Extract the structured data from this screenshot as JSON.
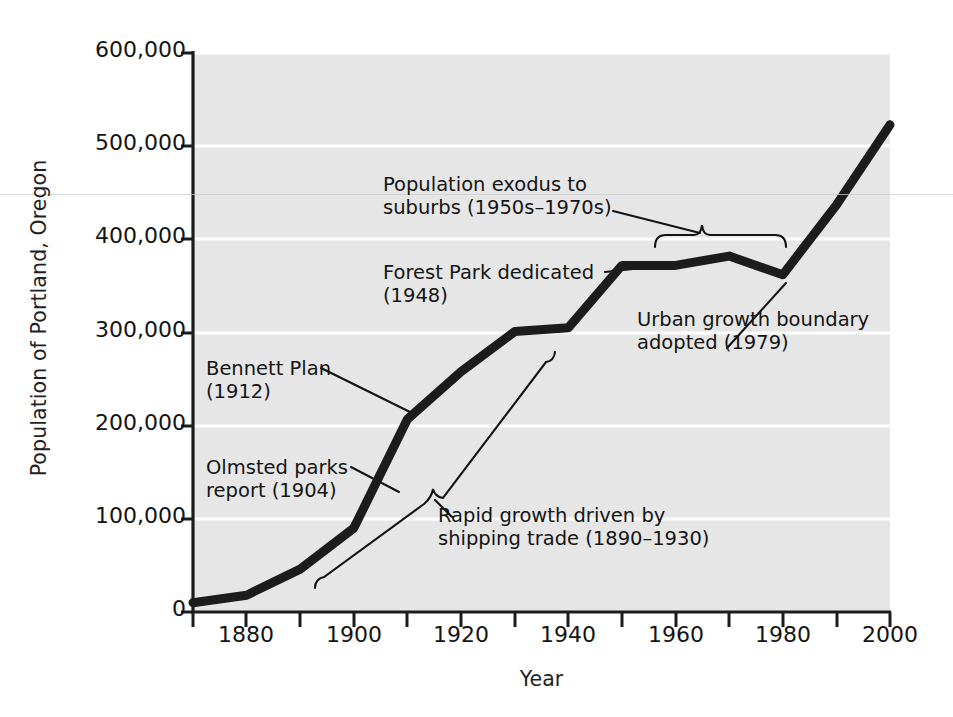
{
  "chart_data": {
    "type": "line",
    "title": "",
    "xlabel": "Year",
    "ylabel": "Population of Portland, Oregon",
    "xlim": [
      1870,
      2000
    ],
    "ylim": [
      0,
      600000
    ],
    "grid": true,
    "legend": "none",
    "x_tick_labels": [
      "1880",
      "1900",
      "1920",
      "1940",
      "1960",
      "1980",
      "2000"
    ],
    "x_tick_values": [
      1880,
      1900,
      1920,
      1940,
      1960,
      1980,
      2000
    ],
    "x_minor_tick_values": [
      1870,
      1890,
      1910,
      1930,
      1950,
      1970,
      1990
    ],
    "y_tick_labels": [
      "0",
      "100,000",
      "200,000",
      "300,000",
      "400,000",
      "500,000",
      "600,000"
    ],
    "y_tick_values": [
      0,
      100000,
      200000,
      300000,
      400000,
      500000,
      600000
    ],
    "series": [
      {
        "name": "Population of Portland, Oregon",
        "color": "#1c1c1c",
        "x": [
          1870,
          1880,
          1890,
          1900,
          1910,
          1920,
          1930,
          1940,
          1950,
          1960,
          1970,
          1980,
          1990,
          2000
        ],
        "values": [
          10000,
          18000,
          46000,
          90000,
          207000,
          258000,
          301000,
          305000,
          372000,
          372000,
          382000,
          362000,
          437000,
          523000
        ]
      }
    ],
    "annotations": [
      {
        "id": "population-exodus",
        "text": "Population exodus to\nsuburbs (1950s–1970s)",
        "points_to": "plateau 1950–1980",
        "marker": "brace"
      },
      {
        "id": "forest-park",
        "text": "Forest Park dedicated\n(1948)",
        "points_to": "1950",
        "marker": "leader-line"
      },
      {
        "id": "urban-growth-boundary",
        "text": "Urban growth boundary\nadopted (1979)",
        "points_to": "1980",
        "marker": "leader-line"
      },
      {
        "id": "bennett-plan",
        "text": "Bennett Plan\n(1912)",
        "points_to": "1912",
        "marker": "leader-line"
      },
      {
        "id": "olmsted-parks",
        "text": "Olmsted parks\nreport (1904)",
        "points_to": "1904",
        "marker": "leader-line"
      },
      {
        "id": "rapid-growth",
        "text": "Rapid growth driven by\nshipping trade (1890–1930)",
        "points_to": "1890–1930",
        "marker": "brace"
      }
    ],
    "colors": {
      "plot_background": "#e6e6e6",
      "gridline": "#ffffff",
      "axis": "#1c1c1c",
      "data_line": "#1c1c1c",
      "page_background": "#ffffff"
    }
  }
}
